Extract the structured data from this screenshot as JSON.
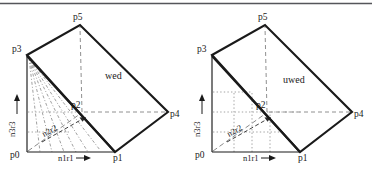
{
  "figure": {
    "title_rule": "top-horizontal-rule",
    "colors": {
      "stroke_solid": "#1a1a1a",
      "stroke_dashed": "#8c8c8c",
      "stroke_dotted": "#9a9a9a",
      "background": "#ffffff",
      "rule": "#55565a"
    },
    "panels": [
      {
        "id": "left",
        "face_label": "wed",
        "vertices": [
          {
            "name": "p0",
            "label": "p0",
            "x": 27,
            "y": 152
          },
          {
            "name": "p1",
            "label": "p1",
            "x": 115,
            "y": 152
          },
          {
            "name": "p2",
            "label": "p2",
            "x": 82,
            "y": 112
          },
          {
            "name": "p3",
            "label": "p3",
            "x": 27,
            "y": 55
          },
          {
            "name": "p4",
            "label": "p4",
            "x": 168,
            "y": 112
          },
          {
            "name": "p5",
            "label": "p5",
            "x": 80,
            "y": 25
          }
        ],
        "axis_labels": [
          {
            "name": "n1r1",
            "label": "n1r1",
            "orientation": "horizontal"
          },
          {
            "name": "n2r2",
            "label": "n2r2",
            "orientation": "diagonal"
          },
          {
            "name": "n3r3",
            "label": "n3r3",
            "orientation": "vertical"
          }
        ],
        "interior_style": "radiating-dashdot-fan-from-p3"
      },
      {
        "id": "right",
        "face_label": "uwed",
        "vertices": [
          {
            "name": "p0",
            "label": "p0",
            "x": 212,
            "y": 152
          },
          {
            "name": "p1",
            "label": "p1",
            "x": 300,
            "y": 152
          },
          {
            "name": "p2",
            "label": "p2",
            "x": 267,
            "y": 112
          },
          {
            "name": "p3",
            "label": "p3",
            "x": 212,
            "y": 55
          },
          {
            "name": "p4",
            "label": "p4",
            "x": 352,
            "y": 112
          },
          {
            "name": "p5",
            "label": "p5",
            "x": 265,
            "y": 25
          }
        ],
        "axis_labels": [
          {
            "name": "n1r1",
            "label": "n1r1",
            "orientation": "horizontal"
          },
          {
            "name": "n2r2",
            "label": "n2r2",
            "orientation": "diagonal"
          },
          {
            "name": "n3r3",
            "label": "n3r3",
            "orientation": "vertical"
          }
        ],
        "interior_style": "orthogonal-dotted-grid"
      }
    ]
  }
}
